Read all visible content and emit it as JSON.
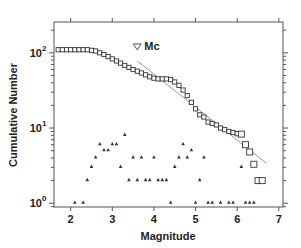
{
  "chart_data": {
    "type": "scatter",
    "title": "",
    "xlabel": "Magnitude",
    "ylabel": "Cumulative Number",
    "xlim": [
      1.6,
      7.1
    ],
    "ylim_log10": [
      -0.05,
      2.41
    ],
    "yscale": "log",
    "x_ticks": [
      2,
      3,
      4,
      5,
      6,
      7
    ],
    "y_ticks": [
      {
        "value": 1,
        "label_base": "10",
        "label_exp": "0"
      },
      {
        "value": 10,
        "label_base": "10",
        "label_exp": "1"
      },
      {
        "value": 100,
        "label_base": "10",
        "label_exp": "2"
      }
    ],
    "grid": false,
    "annotation": {
      "text": "Mc",
      "marker": "inverted-triangle",
      "x": 3.6,
      "y": 78
    },
    "series": [
      {
        "name": "Cumulative number",
        "marker": "open-square",
        "x": [
          1.7,
          1.8,
          1.9,
          2.0,
          2.1,
          2.2,
          2.3,
          2.4,
          2.5,
          2.6,
          2.7,
          2.8,
          2.9,
          3.0,
          3.1,
          3.2,
          3.3,
          3.4,
          3.5,
          3.6,
          3.7,
          3.8,
          3.9,
          4.0,
          4.1,
          4.2,
          4.3,
          4.4,
          4.5,
          4.6,
          4.7,
          4.8,
          4.9,
          5.0,
          5.1,
          5.2,
          5.3,
          5.4,
          5.5,
          5.6,
          5.7,
          5.8,
          5.9,
          6.0,
          6.1,
          6.2,
          6.3,
          6.4,
          6.5,
          6.6
        ],
        "y": [
          110,
          110,
          110,
          110,
          110,
          110,
          110,
          110,
          108,
          106,
          100,
          95,
          89,
          83,
          78,
          73,
          68,
          64,
          60,
          57,
          54,
          51,
          48,
          46,
          45,
          45,
          45,
          44,
          41,
          37,
          32,
          27,
          22,
          18,
          15,
          14,
          12,
          11.5,
          11,
          10,
          9.5,
          9,
          8.7,
          8.4,
          8.3,
          6,
          4.8,
          3.3,
          2,
          2
        ]
      },
      {
        "name": "Non-cumulative number",
        "marker": "filled-triangle",
        "x": [
          2.1,
          2.3,
          2.4,
          2.5,
          2.6,
          2.7,
          2.8,
          2.9,
          3.0,
          3.1,
          3.2,
          3.3,
          3.4,
          3.5,
          3.6,
          3.7,
          3.8,
          3.9,
          4.0,
          4.1,
          4.2,
          4.3,
          4.4,
          4.5,
          4.6,
          4.7,
          4.8,
          4.9,
          5.0,
          5.1,
          5.2,
          5.3,
          5.4,
          5.6,
          5.8,
          5.9,
          6.1,
          6.2,
          6.3,
          6.4,
          6.6
        ],
        "y": [
          1,
          1,
          2,
          3,
          4,
          6,
          5,
          5,
          6,
          6,
          3,
          8,
          2,
          4,
          2,
          4,
          2,
          2,
          4,
          2,
          2,
          2,
          1,
          3,
          4,
          6,
          4,
          5,
          1,
          2,
          4,
          1,
          1,
          1,
          1,
          1,
          3,
          1,
          1,
          1,
          2
        ]
      },
      {
        "name": "Gutenberg-Richter fit",
        "type": "line",
        "color": "#999999",
        "x": [
          3.6,
          6.7
        ],
        "y": [
          78,
          3.4
        ]
      }
    ]
  }
}
